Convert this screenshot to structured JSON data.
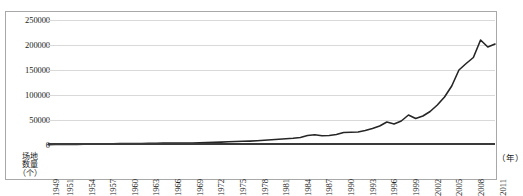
{
  "chart_data": {
    "type": "line",
    "title": "",
    "subtitle": "",
    "xlabel": "（年）",
    "ylabel": "场地数量（个）",
    "ylabel_lines": [
      "场地",
      "数量",
      "（个）"
    ],
    "grid": true,
    "legend": false,
    "legend_position": "none",
    "ylim": [
      0,
      250000
    ],
    "yticks": [
      0,
      50000,
      100000,
      150000,
      200000,
      250000
    ],
    "ytick_labels": [
      "0",
      "50000",
      "100000",
      "150000",
      "200000",
      "250000"
    ],
    "xlim": [
      1949,
      2011
    ],
    "xtick_labels": [
      "1949",
      "1951",
      "1954",
      "1957",
      "1960",
      "1963",
      "1966",
      "1969",
      "1972",
      "1975",
      "1978",
      "1981",
      "1984",
      "1987",
      "1990",
      "1993",
      "1996",
      "1999",
      "2002",
      "2005",
      "2008",
      "2011"
    ],
    "line_color": "#262626",
    "line_width": 1.6,
    "x": [
      1949,
      1950,
      1951,
      1952,
      1953,
      1954,
      1955,
      1956,
      1957,
      1958,
      1959,
      1960,
      1961,
      1962,
      1963,
      1964,
      1965,
      1966,
      1967,
      1968,
      1969,
      1970,
      1971,
      1972,
      1973,
      1974,
      1975,
      1976,
      1977,
      1978,
      1979,
      1980,
      1981,
      1982,
      1983,
      1984,
      1985,
      1986,
      1987,
      1988,
      1989,
      1990,
      1991,
      1992,
      1993,
      1994,
      1995,
      1996,
      1997,
      1998,
      1999,
      2000,
      2001,
      2002,
      2003,
      2004,
      2005,
      2006,
      2007,
      2008,
      2009,
      2010,
      2011
    ],
    "values": [
      800,
      900,
      1000,
      1100,
      1300,
      1500,
      1700,
      2000,
      2300,
      2600,
      2800,
      3000,
      3000,
      3100,
      3300,
      3600,
      3900,
      4000,
      3900,
      3800,
      4000,
      4300,
      4700,
      5200,
      5800,
      6400,
      7000,
      7400,
      7800,
      8500,
      9500,
      10500,
      11500,
      12500,
      13500,
      15000,
      19000,
      20500,
      18500,
      19000,
      21000,
      25000,
      25500,
      26000,
      29000,
      33000,
      38000,
      46000,
      42000,
      48000,
      60000,
      53000,
      58000,
      67000,
      80000,
      96000,
      118000,
      150000,
      163000,
      175000,
      210000,
      196000,
      202000
    ],
    "annotations": []
  }
}
